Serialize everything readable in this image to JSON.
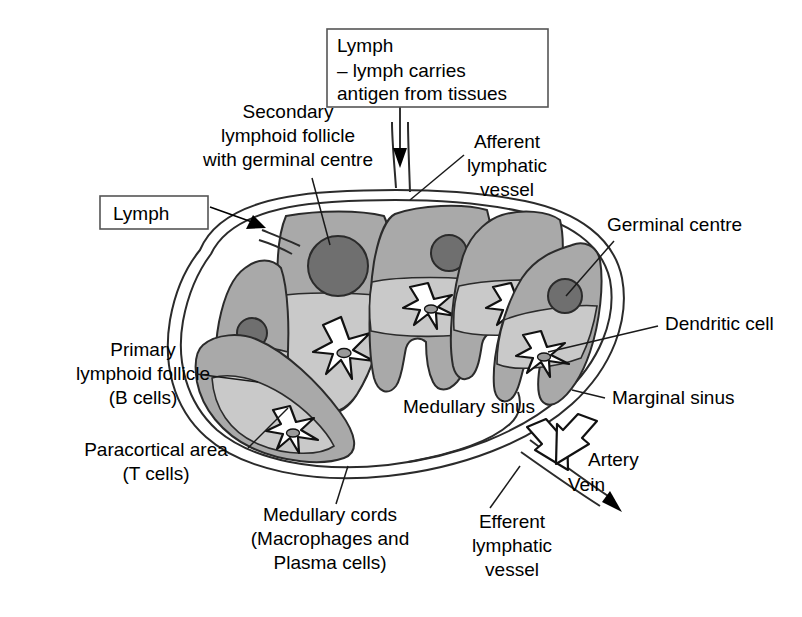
{
  "figure": {
    "background_color": "#ffffff"
  },
  "colors": {
    "follicle_gray": "#a9a9a9",
    "germinal_center_gray": "#6f6f6f",
    "paracortex_light_gray": "#c9c9c9",
    "medulla_gray": "#a9a9a9",
    "outline_black": "#2b2b2b",
    "text_black": "#000000",
    "box_border": "#555555"
  },
  "callout_boxes": [
    {
      "id": "lymph-antigen-box",
      "lines": [
        "Lymph",
        "– lymph carries",
        "   antigen from tissues"
      ]
    },
    {
      "id": "lymph-box",
      "lines": [
        "Lymph"
      ]
    }
  ],
  "labels": {
    "secondary_follicle": [
      "Secondary",
      "lymphoid follicle",
      "with germinal centre"
    ],
    "afferent_vessel": [
      "Afferent",
      "lymphatic",
      "vessel"
    ],
    "germinal_centre": [
      "Germinal centre"
    ],
    "dendritic_cell": [
      "Dendritic cell"
    ],
    "marginal_sinus": [
      "Marginal sinus"
    ],
    "medullary_sinus": [
      "Medullary sinus"
    ],
    "primary_follicle": [
      "Primary",
      "lymphoid follicle",
      "(B cells)"
    ],
    "paracortical_area": [
      "Paracortical area",
      "(T cells)"
    ],
    "medullary_cords": [
      "Medullary cords",
      "(Macrophages and",
      "Plasma cells)"
    ],
    "efferent_vessel": [
      "Efferent",
      "lymphatic",
      "vessel"
    ],
    "artery": [
      "Artery"
    ],
    "vein": [
      "Vein"
    ]
  }
}
